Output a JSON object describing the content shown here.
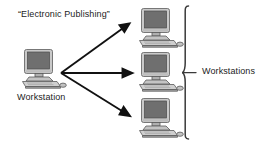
{
  "diagram": {
    "title": "“Electronic Publishing”",
    "source_node_label": "Workstation",
    "group_label": "Workstations",
    "nodes": [
      {
        "id": "source",
        "icon": "desktop-computer-icon",
        "label": "Workstation",
        "role": "source"
      },
      {
        "id": "ws-1",
        "icon": "desktop-computer-icon",
        "label": "",
        "role": "workstation"
      },
      {
        "id": "ws-2",
        "icon": "desktop-computer-icon",
        "label": "",
        "role": "workstation"
      },
      {
        "id": "ws-3",
        "icon": "desktop-computer-icon",
        "label": "",
        "role": "workstation"
      }
    ],
    "connectors": [
      {
        "from": "source",
        "to": "ws-1",
        "style": "arrow",
        "direction": "up-right"
      },
      {
        "from": "source",
        "to": "ws-2",
        "style": "arrow",
        "direction": "right"
      },
      {
        "from": "source",
        "to": "ws-3",
        "style": "arrow",
        "direction": "down-right"
      }
    ],
    "grouping_bracket": {
      "shape": "curly-brace-right",
      "label": "Workstations"
    },
    "colors": {
      "background": "#ffffff",
      "text": "#1c1c1c",
      "arrow": "#111111",
      "brace": "#333333",
      "case_light": "#d2d2d2",
      "case_mid": "#b5b5b5",
      "case_dark": "#8e8e8e",
      "screen": "#6f6f6f",
      "outline": "#5a5a5a"
    }
  }
}
